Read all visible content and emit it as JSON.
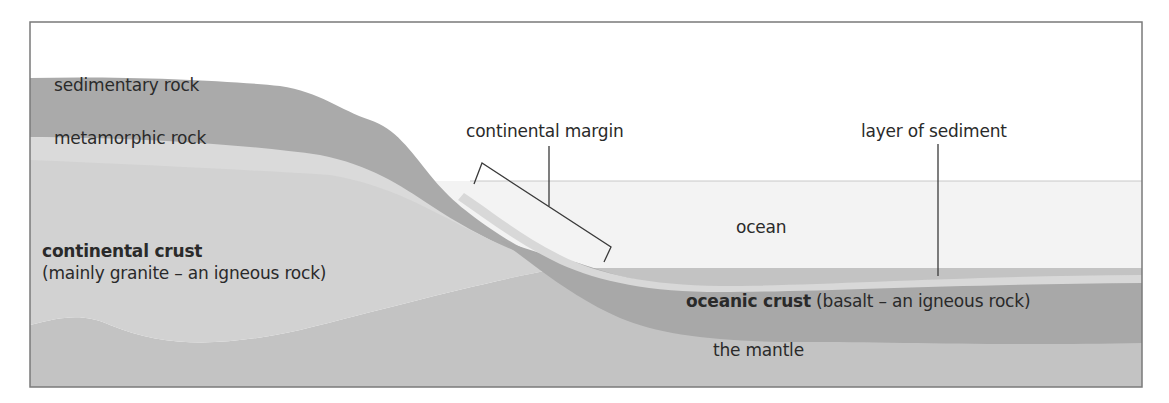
{
  "diagram": {
    "colors": {
      "background": "#ffffff",
      "frame": "#7a7a7a",
      "sedimentary_rock": "#a9a9a9",
      "metamorphic_rock": "#d9d9d9",
      "continental_crust": "#d2d2d2",
      "mantle": "#c2c2c2",
      "oceanic_crust": "#a8a8a8",
      "sediment_layer": "#d8d8d8",
      "ocean": "#f3f3f3",
      "leader_lines": "#3a3a3a"
    },
    "labels": {
      "sedimentary_rock": "sedimentary rock",
      "metamorphic_rock": "metamorphic rock",
      "continental_crust_title": "continental crust",
      "continental_crust_desc": "(mainly granite – an igneous rock)",
      "continental_margin": "continental margin",
      "layer_of_sediment": "layer of sediment",
      "ocean": "ocean",
      "oceanic_crust_title": "oceanic crust",
      "oceanic_crust_desc": " (basalt – an igneous rock)",
      "mantle": "the mantle"
    }
  }
}
